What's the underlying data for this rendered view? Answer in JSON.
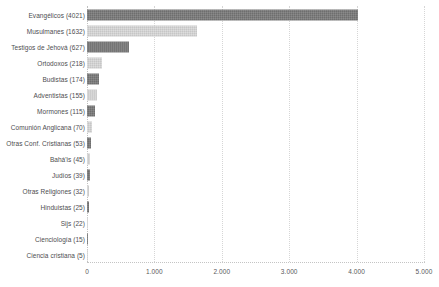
{
  "chart_data": {
    "type": "bar",
    "orientation": "horizontal",
    "title": "",
    "subtitle": "",
    "xlabel": "",
    "ylabel": "",
    "xlim": [
      0,
      5000
    ],
    "grid": true,
    "legend": null,
    "x_ticks": [
      {
        "value": 0,
        "label": "0"
      },
      {
        "value": 1000,
        "label": "1.000"
      },
      {
        "value": 2000,
        "label": "2.000"
      },
      {
        "value": 3000,
        "label": "3.000"
      },
      {
        "value": 4000,
        "label": "4.000"
      },
      {
        "value": 5000,
        "label": "5.000"
      }
    ],
    "categories": [
      "Evangélicos (4021)",
      "Musulmanes (1632)",
      "Testigos de Jehová (627)",
      "Ortodoxos (218)",
      "Budistas (174)",
      "Adventistas (155)",
      "Mormones (115)",
      "Comunión Anglicana (70)",
      "Otras Conf. Cristianas (53)",
      "Bahá'is (45)",
      "Judíos (39)",
      "Otras Religiones (32)",
      "Hinduistas (25)",
      "Sijs (22)",
      "Cienciología (15)",
      "Ciencia cristiana (5)"
    ],
    "values": [
      4021,
      1632,
      627,
      218,
      174,
      155,
      115,
      70,
      53,
      45,
      39,
      32,
      25,
      22,
      15,
      5
    ],
    "bar_colors": [
      "#6e6e6e",
      "#c6c6c6",
      "#6e6e6e",
      "#c6c6c6",
      "#6e6e6e",
      "#c6c6c6",
      "#6e6e6e",
      "#c6c6c6",
      "#6e6e6e",
      "#c6c6c6",
      "#6e6e6e",
      "#c6c6c6",
      "#6e6e6e",
      "#c6c6c6",
      "#6e6e6e",
      "#c6c6c6"
    ]
  },
  "style": {
    "background": "#ffffff",
    "grid_color": "#d6d6d6",
    "axis_color": "#c4c4c4",
    "label_color": "#4d4d4f",
    "tick_color": "#58585a",
    "color_dark": "#6e6e6e",
    "color_light": "#c6c6c6"
  }
}
